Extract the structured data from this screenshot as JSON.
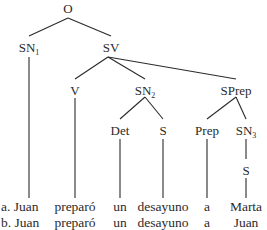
{
  "tree": {
    "nodes": [
      {
        "id": "O",
        "label": "O",
        "sub": "",
        "x": 68,
        "y": 2
      },
      {
        "id": "SN1",
        "label": "SN",
        "sub": "1",
        "x": 29,
        "y": 41
      },
      {
        "id": "SV",
        "label": "SV",
        "sub": "",
        "x": 111,
        "y": 41
      },
      {
        "id": "V",
        "label": "V",
        "sub": "",
        "x": 75,
        "y": 84
      },
      {
        "id": "SN2",
        "label": "SN",
        "sub": "2",
        "x": 145,
        "y": 84
      },
      {
        "id": "SPrep",
        "label": "SPrep",
        "sub": "",
        "x": 236,
        "y": 84
      },
      {
        "id": "Det",
        "label": "Det",
        "sub": "",
        "x": 120,
        "y": 124
      },
      {
        "id": "S2",
        "label": "S",
        "sub": "",
        "x": 163,
        "y": 124
      },
      {
        "id": "Prep",
        "label": "Prep",
        "sub": "",
        "x": 207,
        "y": 124
      },
      {
        "id": "SN3",
        "label": "SN",
        "sub": "3",
        "x": 246,
        "y": 124
      },
      {
        "id": "S3",
        "label": "S",
        "sub": "",
        "x": 246,
        "y": 164
      }
    ],
    "edges": [
      [
        68,
        18,
        29,
        36
      ],
      [
        68,
        18,
        111,
        36
      ],
      [
        29,
        57,
        29,
        198
      ],
      [
        108,
        57,
        75,
        79
      ],
      [
        108,
        57,
        145,
        79
      ],
      [
        108,
        57,
        236,
        79
      ],
      [
        75,
        98,
        75,
        198
      ],
      [
        145,
        97,
        120,
        119
      ],
      [
        145,
        97,
        163,
        119
      ],
      [
        120,
        139,
        120,
        198
      ],
      [
        163,
        139,
        163,
        198
      ],
      [
        236,
        97,
        207,
        119
      ],
      [
        236,
        97,
        246,
        119
      ],
      [
        207,
        139,
        207,
        198
      ],
      [
        246,
        139,
        246,
        159
      ],
      [
        246,
        178,
        246,
        198
      ]
    ]
  },
  "sentences": [
    {
      "marker": "a.",
      "words": [
        "Juan",
        "preparó",
        "un",
        "desayuno",
        "a",
        "Marta"
      ]
    },
    {
      "marker": "b.",
      "words": [
        "Juan",
        "preparó",
        "un",
        "desayuno",
        "a",
        "Juan"
      ]
    }
  ],
  "word_x": [
    30,
    75,
    120,
    163,
    207,
    246
  ]
}
